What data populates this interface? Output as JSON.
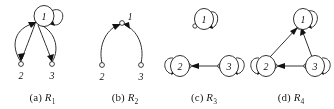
{
  "figure": {
    "background_color": "#ffffff",
    "ink_color": "#1a1a1a",
    "panel_count": 4
  },
  "panels": [
    {
      "id": "a",
      "caption_prefix": "(a)",
      "caption_symbol": "R",
      "caption_subscript": "1",
      "caption_full": "(a) R1",
      "node_style": "ellipse-labelled-top, open-dot-bottom",
      "nodes": [
        {
          "label": "1",
          "x": 44,
          "y": 16,
          "shape": "ellipse"
        },
        {
          "label": "2",
          "x": 22,
          "y": 64,
          "shape": "dot"
        },
        {
          "label": "3",
          "x": 51,
          "y": 64,
          "shape": "dot"
        }
      ],
      "edges": [
        {
          "from": "1",
          "to": "1",
          "type": "self-loop"
        },
        {
          "from": "1",
          "to": "2",
          "type": "curve"
        },
        {
          "from": "1",
          "to": "3",
          "type": "curve"
        },
        {
          "from": "2",
          "to": "1",
          "type": "curve"
        },
        {
          "from": "3",
          "to": "1",
          "type": "curve"
        }
      ]
    },
    {
      "id": "b",
      "caption_prefix": "(b)",
      "caption_symbol": "R",
      "caption_subscript": "2",
      "caption_full": "(b) R2",
      "node_style": "open-dot",
      "nodes": [
        {
          "label": "1",
          "x": 38,
          "y": 24,
          "shape": "dot"
        },
        {
          "label": "2",
          "x": 18,
          "y": 65,
          "shape": "dot"
        },
        {
          "label": "3",
          "x": 55,
          "y": 65,
          "shape": "dot"
        }
      ],
      "edges": [
        {
          "from": "2",
          "to": "1",
          "type": "curve"
        },
        {
          "from": "3",
          "to": "1",
          "type": "curve"
        }
      ]
    },
    {
      "id": "c",
      "caption_prefix": "(c)",
      "caption_symbol": "R",
      "caption_subscript": "3",
      "caption_full": "(c) R3",
      "node_style": "ellipse",
      "nodes": [
        {
          "label": "1",
          "x": 44,
          "y": 20,
          "shape": "ellipse"
        },
        {
          "label": "2",
          "x": 20,
          "y": 66,
          "shape": "ellipse"
        },
        {
          "label": "3",
          "x": 70,
          "y": 66,
          "shape": "ellipse"
        }
      ],
      "edges": [
        {
          "from": "1",
          "to": "1",
          "type": "self-loop"
        },
        {
          "from": "2",
          "to": "2",
          "type": "self-loop"
        },
        {
          "from": "3",
          "to": "3",
          "type": "self-loop"
        },
        {
          "from": "3",
          "to": "2",
          "type": "straight"
        }
      ]
    },
    {
      "id": "d",
      "caption_prefix": "(d)",
      "caption_symbol": "R",
      "caption_subscript": "4",
      "caption_full": "(d) R4",
      "node_style": "ellipse",
      "nodes": [
        {
          "label": "1",
          "x": 55,
          "y": 20,
          "shape": "ellipse"
        },
        {
          "label": "2",
          "x": 18,
          "y": 66,
          "shape": "ellipse"
        },
        {
          "label": "3",
          "x": 68,
          "y": 66,
          "shape": "ellipse"
        }
      ],
      "edges": [
        {
          "from": "1",
          "to": "1",
          "type": "self-loop"
        },
        {
          "from": "2",
          "to": "2",
          "type": "self-loop"
        },
        {
          "from": "3",
          "to": "3",
          "type": "self-loop"
        },
        {
          "from": "2",
          "to": "1",
          "type": "straight"
        },
        {
          "from": "3",
          "to": "1",
          "type": "straight"
        },
        {
          "from": "3",
          "to": "2",
          "type": "straight"
        }
      ]
    }
  ]
}
